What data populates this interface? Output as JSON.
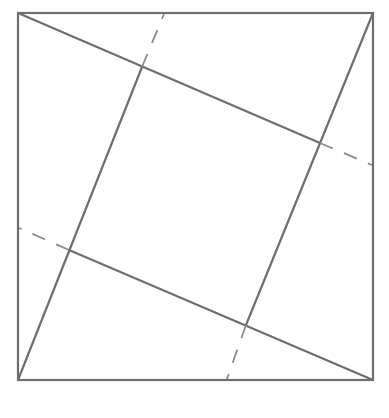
{
  "diagram": {
    "stroke_color": "#6e6e6e",
    "dash_color": "#8a8a8a",
    "outer_square": {
      "x1": 18,
      "y1": 13,
      "x2": 373,
      "y2": 380
    },
    "solid_lines": [
      {
        "name": "top-left-to-right-inner",
        "x1": 18,
        "y1": 13,
        "x2": 320,
        "y2": 143
      },
      {
        "name": "top-right-to-bottom-inner",
        "x1": 373,
        "y1": 13,
        "x2": 246,
        "y2": 325
      },
      {
        "name": "bottom-right-to-left-inner",
        "x1": 373,
        "y1": 380,
        "x2": 69,
        "y2": 250
      },
      {
        "name": "bottom-left-to-top-inner",
        "x1": 18,
        "y1": 380,
        "x2": 142,
        "y2": 67
      }
    ],
    "dashed_lines": [
      {
        "name": "top-dash",
        "x1": 142,
        "y1": 67,
        "x2": 164,
        "y2": 14
      },
      {
        "name": "right-dash",
        "x1": 320,
        "y1": 143,
        "x2": 372,
        "y2": 165
      },
      {
        "name": "bottom-dash",
        "x1": 246,
        "y1": 325,
        "x2": 227,
        "y2": 379
      },
      {
        "name": "left-dash",
        "x1": 69,
        "y1": 250,
        "x2": 19,
        "y2": 228
      }
    ],
    "inner_square_vertices": [
      [
        142,
        67
      ],
      [
        320,
        143
      ],
      [
        246,
        325
      ],
      [
        69,
        250
      ]
    ]
  }
}
